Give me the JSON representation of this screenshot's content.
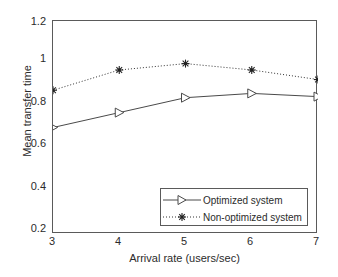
{
  "chart_data": {
    "type": "line",
    "title": "",
    "xlabel": "Arrival rate (users/sec)",
    "ylabel": "Mean transfer time",
    "x": [
      3,
      4,
      5,
      6,
      7
    ],
    "xlim": [
      3,
      7
    ],
    "ylim": [
      0.2,
      1.2
    ],
    "xticks": [
      "3",
      "4",
      "5",
      "6",
      "7"
    ],
    "yticks": [
      "0.2",
      "0.4",
      "0.6",
      "0.8",
      "1",
      "1.2"
    ],
    "grid": false,
    "legend_position": "lower right",
    "series": [
      {
        "name": "Optimized system",
        "values": [
          0.7,
          0.77,
          0.84,
          0.86,
          0.845
        ],
        "linestyle": "solid",
        "marker": "triangle-right",
        "color": "#4a4a4a"
      },
      {
        "name": "Non-optimized system",
        "values": [
          0.875,
          0.97,
          1.0,
          0.97,
          0.925
        ],
        "linestyle": "dotted",
        "marker": "star",
        "color": "#333333"
      }
    ]
  },
  "axes": {
    "ylabel": "Mean transfer time",
    "xlabel": "Arrival rate (users/sec)",
    "ytick_labels": [
      "1.2",
      "1",
      "0.8",
      "0.6",
      "0.4",
      "0.2"
    ],
    "xtick_labels": [
      "3",
      "4",
      "5",
      "6",
      "7"
    ]
  },
  "legend": {
    "entries": [
      {
        "label": "Optimized system"
      },
      {
        "label": "Non-optimized system"
      }
    ]
  }
}
